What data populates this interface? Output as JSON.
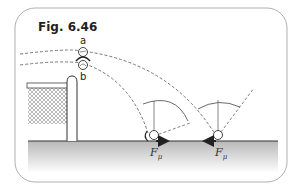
{
  "figure": {
    "title": "Fig. 6.46",
    "ball_labels": {
      "a": "a",
      "b": "b"
    },
    "force_label": {
      "symbol": "F",
      "subscript": "μ"
    },
    "colors": {
      "frame": "#b0b0b0",
      "line": "#444444",
      "dashed": "#666666",
      "ground_top": "#b8b8b8",
      "ground_bottom": "#ffffff",
      "net": "#888888"
    }
  }
}
